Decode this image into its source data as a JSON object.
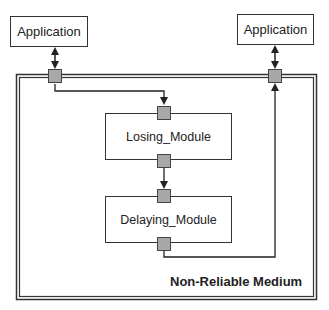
{
  "diagram": {
    "nodes": {
      "app_left": {
        "label": "Application"
      },
      "app_right": {
        "label": "Application"
      },
      "losing": {
        "label": "Losing_Module"
      },
      "delaying": {
        "label": "Delaying_Module"
      }
    },
    "container": {
      "label": "Non-Reliable Medium"
    },
    "colors": {
      "line": "#222222",
      "port_fill": "#a8a8a8",
      "border": "#333333"
    },
    "edges": [
      {
        "from": "app_left",
        "to": "medium_port_left",
        "type": "bidirectional"
      },
      {
        "from": "app_right",
        "to": "medium_port_right",
        "type": "bidirectional"
      },
      {
        "from": "medium_port_left",
        "to": "losing",
        "type": "directed"
      },
      {
        "from": "losing",
        "to": "delaying",
        "type": "directed"
      },
      {
        "from": "delaying",
        "to": "medium_port_right",
        "type": "directed"
      }
    ]
  }
}
